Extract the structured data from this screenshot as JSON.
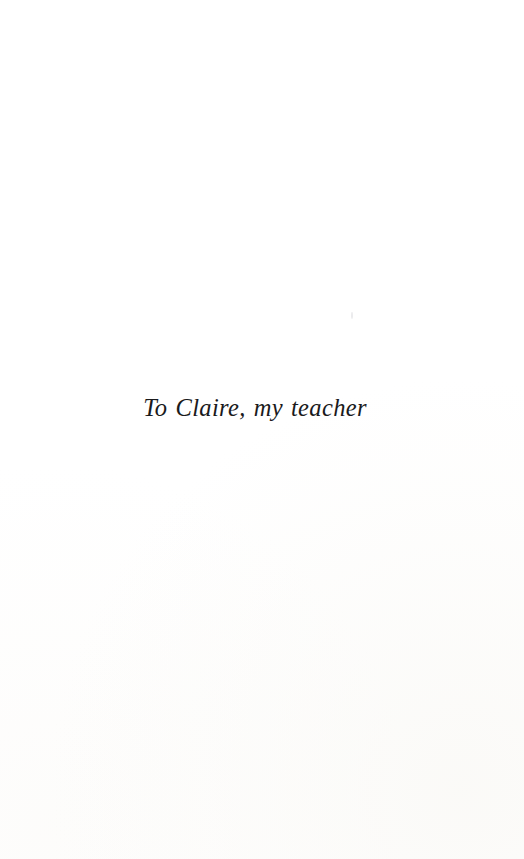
{
  "page": {
    "kind": "book-dedication-page",
    "background_color": "#ffffff",
    "width": 524,
    "height": 859
  },
  "dedication": {
    "text": "To Claire, my teacher",
    "style": "italic-serif",
    "text_color": "#1a1a1c",
    "alignment": "center"
  },
  "artifacts": {
    "speck_color": "#bebec4"
  }
}
